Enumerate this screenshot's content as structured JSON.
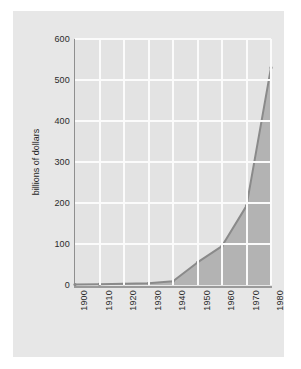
{
  "figure": {
    "background_color": "#ffffff",
    "panel_color": "#e7e7e7",
    "plot_background_color": "#e3e3e3",
    "gridline_color": "#fbfbfb",
    "axis_color": "#8f8f8f",
    "area_fill_color": "#b3b3b3",
    "line_color": "#8a8a8a",
    "marker_color": "#8a8a8a"
  },
  "chart_data": {
    "type": "area",
    "title": "",
    "subtitle": "",
    "xlabel": "",
    "ylabel": "billions of dollars",
    "x": [
      1900,
      1910,
      1920,
      1930,
      1940,
      1950,
      1960,
      1970,
      1980
    ],
    "values": [
      1,
      2,
      3,
      4,
      9,
      55,
      95,
      193,
      530
    ],
    "series": [
      {
        "name": "billions of dollars",
        "values": [
          1,
          2,
          3,
          4,
          9,
          55,
          95,
          193,
          530
        ]
      }
    ],
    "categories": [
      "1900",
      "1910",
      "1920",
      "1930",
      "1940",
      "1950",
      "1960",
      "1970",
      "1980"
    ],
    "xlim": [
      1900,
      1980
    ],
    "ylim": [
      0,
      600
    ],
    "ytick_labels": [
      "0",
      "100",
      "200",
      "300",
      "400",
      "500",
      "600"
    ],
    "ytick_values": [
      0,
      100,
      200,
      300,
      400,
      500,
      600
    ],
    "xtick_labels": [
      "1900",
      "1910",
      "1920",
      "1930",
      "1940",
      "1950",
      "1960",
      "1970",
      "1980"
    ],
    "xtick_values": [
      1900,
      1910,
      1920,
      1930,
      1940,
      1950,
      1960,
      1970,
      1980
    ],
    "xtick_rotation": 90,
    "grid": true,
    "grid_axis": "both",
    "legend": false,
    "legend_position": "none",
    "annotations": []
  }
}
